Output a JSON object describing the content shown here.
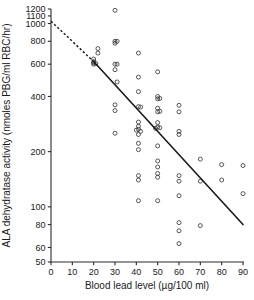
{
  "chart_data": {
    "type": "scatter",
    "title": "",
    "xlabel": "Blood lead level (µg/100 ml)",
    "ylabel": "ALA dehydratase activity (nmoles PBG/ml RBC/hr)",
    "xlim": [
      0,
      90
    ],
    "ylim": [
      50,
      1200
    ],
    "yscale": "log",
    "xscale": "linear",
    "grid": false,
    "legend": false,
    "xticks": [
      0,
      10,
      20,
      30,
      40,
      50,
      60,
      70,
      80,
      90
    ],
    "xticklabels": [
      "0",
      "10",
      "20",
      "30",
      "40",
      "50",
      "60",
      "70",
      "80",
      "90"
    ],
    "yticks": [
      50,
      60,
      80,
      100,
      200,
      400,
      600,
      800,
      1000,
      1100,
      1200
    ],
    "yticklabels": [
      "50",
      "60",
      "80",
      "100",
      "200",
      "400",
      "600",
      "800",
      "1000",
      "1100",
      "1200"
    ],
    "points": [
      [
        20,
        610
      ],
      [
        20,
        620
      ],
      [
        20,
        640
      ],
      [
        20,
        600
      ],
      [
        21,
        605
      ],
      [
        22,
        690
      ],
      [
        22,
        730
      ],
      [
        30,
        1180
      ],
      [
        30,
        780
      ],
      [
        30,
        800
      ],
      [
        31,
        800
      ],
      [
        30,
        560
      ],
      [
        30,
        600
      ],
      [
        31,
        600
      ],
      [
        31,
        480
      ],
      [
        30,
        360
      ],
      [
        30,
        335
      ],
      [
        30,
        252
      ],
      [
        41,
        690
      ],
      [
        41,
        510
      ],
      [
        41,
        425
      ],
      [
        41,
        352
      ],
      [
        42,
        350
      ],
      [
        41,
        290
      ],
      [
        41,
        275
      ],
      [
        41,
        265
      ],
      [
        40,
        262
      ],
      [
        42,
        258
      ],
      [
        41,
        248
      ],
      [
        41,
        222
      ],
      [
        41,
        205
      ],
      [
        41,
        148
      ],
      [
        41,
        140
      ],
      [
        41,
        108
      ],
      [
        50,
        545
      ],
      [
        50,
        400
      ],
      [
        50,
        388
      ],
      [
        51,
        390
      ],
      [
        50,
        345
      ],
      [
        50,
        330
      ],
      [
        51,
        332
      ],
      [
        50,
        288
      ],
      [
        50,
        272
      ],
      [
        51,
        270
      ],
      [
        49,
        268
      ],
      [
        50,
        215
      ],
      [
        50,
        178
      ],
      [
        50,
        165
      ],
      [
        50,
        152
      ],
      [
        50,
        145
      ],
      [
        50,
        108
      ],
      [
        60,
        358
      ],
      [
        60,
        330
      ],
      [
        60,
        258
      ],
      [
        60,
        248
      ],
      [
        60,
        148
      ],
      [
        60,
        138
      ],
      [
        60,
        115
      ],
      [
        60,
        82
      ],
      [
        60,
        74
      ],
      [
        60,
        63
      ],
      [
        70,
        182
      ],
      [
        70,
        138
      ],
      [
        70,
        79
      ],
      [
        80,
        170
      ],
      [
        80,
        140
      ],
      [
        90,
        168
      ],
      [
        90,
        118
      ]
    ],
    "fit_line": {
      "solid_from": [
        20,
        620
      ],
      "solid_to": [
        90,
        80
      ],
      "dashed_from": [
        0,
        1030
      ],
      "dashed_to": [
        20,
        620
      ],
      "style_solid": "solid",
      "style_dashed": "dashed"
    },
    "colors": {
      "axis": "#2b2b2b",
      "point": "#3a3a3a",
      "fit": "#1a1a1a",
      "background": "#ffffff"
    }
  }
}
